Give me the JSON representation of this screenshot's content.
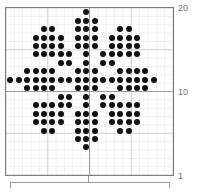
{
  "figure": {
    "title": "",
    "background_color": "#ffffff",
    "dot_color": "#111111",
    "grid_minor_color": "#e4e4e4",
    "grid_major_color": "#c9c9c9",
    "axis_line_color": "#9a9a9a",
    "frame_color": "#7b7b7b",
    "tick_text_color": "#6f6f6f"
  },
  "axes": {
    "y_tick_labels": [
      "20",
      "10",
      "1"
    ],
    "x_tick_labels": [],
    "y_ticks": [
      20,
      10,
      1
    ],
    "x_range": [
      1,
      20
    ],
    "y_range": [
      1,
      20
    ],
    "grid": "minor and major",
    "tick_label_position": "right"
  },
  "chart_data": {
    "type": "scatter",
    "title": "",
    "xlabel": "",
    "ylabel": "",
    "xlim": [
      0.5,
      20.5
    ],
    "ylim": [
      0.5,
      20.5
    ],
    "grid": true,
    "legend": "none",
    "marker": "filled circle",
    "marker_color": "#111111",
    "point_count": 156,
    "points": [
      [
        10,
        20
      ],
      [
        9,
        19
      ],
      [
        10,
        19
      ],
      [
        11,
        19
      ],
      [
        5,
        18
      ],
      [
        6,
        18
      ],
      [
        9,
        18
      ],
      [
        10,
        18
      ],
      [
        11,
        18
      ],
      [
        14,
        18
      ],
      [
        15,
        18
      ],
      [
        4,
        17
      ],
      [
        5,
        17
      ],
      [
        6,
        17
      ],
      [
        7,
        17
      ],
      [
        9,
        17
      ],
      [
        10,
        17
      ],
      [
        11,
        17
      ],
      [
        13,
        17
      ],
      [
        14,
        17
      ],
      [
        15,
        17
      ],
      [
        16,
        17
      ],
      [
        4,
        16
      ],
      [
        5,
        16
      ],
      [
        6,
        16
      ],
      [
        7,
        16
      ],
      [
        9,
        16
      ],
      [
        10,
        16
      ],
      [
        11,
        16
      ],
      [
        13,
        16
      ],
      [
        14,
        16
      ],
      [
        15,
        16
      ],
      [
        16,
        16
      ],
      [
        4,
        15
      ],
      [
        5,
        15
      ],
      [
        6,
        15
      ],
      [
        7,
        15
      ],
      [
        8,
        15
      ],
      [
        10,
        15
      ],
      [
        12,
        15
      ],
      [
        13,
        15
      ],
      [
        14,
        15
      ],
      [
        15,
        15
      ],
      [
        16,
        15
      ],
      [
        7,
        14
      ],
      [
        8,
        14
      ],
      [
        10,
        14
      ],
      [
        12,
        14
      ],
      [
        13,
        14
      ],
      [
        3,
        13
      ],
      [
        4,
        13
      ],
      [
        5,
        13
      ],
      [
        6,
        13
      ],
      [
        9,
        13
      ],
      [
        10,
        13
      ],
      [
        11,
        13
      ],
      [
        14,
        13
      ],
      [
        15,
        13
      ],
      [
        16,
        13
      ],
      [
        17,
        13
      ],
      [
        1,
        12
      ],
      [
        2,
        12
      ],
      [
        3,
        12
      ],
      [
        4,
        12
      ],
      [
        5,
        12
      ],
      [
        6,
        12
      ],
      [
        7,
        12
      ],
      [
        8,
        12
      ],
      [
        9,
        12
      ],
      [
        10,
        12
      ],
      [
        11,
        12
      ],
      [
        12,
        12
      ],
      [
        13,
        12
      ],
      [
        14,
        12
      ],
      [
        15,
        12
      ],
      [
        16,
        12
      ],
      [
        17,
        12
      ],
      [
        18,
        12
      ],
      [
        3,
        11
      ],
      [
        4,
        11
      ],
      [
        5,
        11
      ],
      [
        6,
        11
      ],
      [
        9,
        11
      ],
      [
        10,
        11
      ],
      [
        11,
        11
      ],
      [
        14,
        11
      ],
      [
        15,
        11
      ],
      [
        16,
        11
      ],
      [
        17,
        11
      ],
      [
        7,
        10
      ],
      [
        8,
        10
      ],
      [
        10,
        10
      ],
      [
        12,
        10
      ],
      [
        13,
        10
      ],
      [
        4,
        9
      ],
      [
        5,
        9
      ],
      [
        6,
        9
      ],
      [
        7,
        9
      ],
      [
        8,
        9
      ],
      [
        10,
        9
      ],
      [
        12,
        9
      ],
      [
        13,
        9
      ],
      [
        14,
        9
      ],
      [
        15,
        9
      ],
      [
        16,
        9
      ],
      [
        4,
        8
      ],
      [
        5,
        8
      ],
      [
        6,
        8
      ],
      [
        7,
        8
      ],
      [
        9,
        8
      ],
      [
        10,
        8
      ],
      [
        11,
        8
      ],
      [
        13,
        8
      ],
      [
        14,
        8
      ],
      [
        15,
        8
      ],
      [
        16,
        8
      ],
      [
        4,
        7
      ],
      [
        5,
        7
      ],
      [
        6,
        7
      ],
      [
        7,
        7
      ],
      [
        9,
        7
      ],
      [
        10,
        7
      ],
      [
        11,
        7
      ],
      [
        13,
        7
      ],
      [
        14,
        7
      ],
      [
        15,
        7
      ],
      [
        16,
        7
      ],
      [
        5,
        6
      ],
      [
        6,
        6
      ],
      [
        9,
        6
      ],
      [
        10,
        6
      ],
      [
        11,
        6
      ],
      [
        14,
        6
      ],
      [
        15,
        6
      ],
      [
        9,
        5
      ],
      [
        10,
        5
      ],
      [
        11,
        5
      ],
      [
        10,
        4
      ]
    ]
  }
}
